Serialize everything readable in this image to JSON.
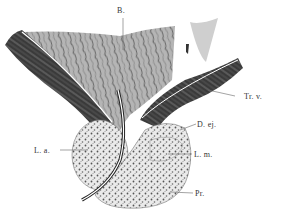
{
  "figure": {
    "labels": {
      "b": "B.",
      "tr_v": "Tr. v.",
      "d_ej": "D. ej.",
      "l_a": "L. a.",
      "l_m": "L. m.",
      "pr": "Pr."
    }
  }
}
